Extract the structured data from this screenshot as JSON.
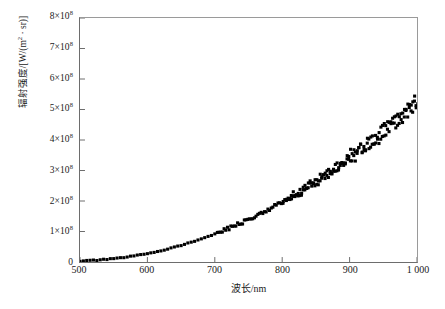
{
  "chart_data": {
    "type": "scatter",
    "title": "",
    "xlabel": "波长/nm",
    "ylabel": "辐射强度/[W/(m²·sr)]",
    "xlim": [
      500,
      1000
    ],
    "ylim": [
      0,
      800000000
    ],
    "y_exponent": 8,
    "y_scale_factor": 100000000,
    "grid": false,
    "legend": null,
    "marker": "square",
    "marker_color": "#000000",
    "marker_size_px": 3.1,
    "xticks": [
      500,
      600,
      700,
      800,
      900,
      1000
    ],
    "xtick_labels": [
      "500",
      "600",
      "700",
      "800",
      "900",
      "1 000"
    ],
    "yticks": [
      0,
      100000000,
      200000000,
      300000000,
      400000000,
      500000000,
      600000000,
      700000000,
      800000000
    ],
    "ytick_labels": [
      {
        "mantissa": "0",
        "has_power": false,
        "exponent": ""
      },
      {
        "mantissa": "1×10",
        "has_power": true,
        "exponent": "8"
      },
      {
        "mantissa": "2×10",
        "has_power": true,
        "exponent": "8"
      },
      {
        "mantissa": "3×10",
        "has_power": true,
        "exponent": "8"
      },
      {
        "mantissa": "4×10",
        "has_power": true,
        "exponent": "8"
      },
      {
        "mantissa": "5×10",
        "has_power": true,
        "exponent": "8"
      },
      {
        "mantissa": "6×10",
        "has_power": true,
        "exponent": "8"
      },
      {
        "mantissa": "7×10",
        "has_power": true,
        "exponent": "8"
      },
      {
        "mantissa": "8×10",
        "has_power": true,
        "exponent": "8"
      }
    ],
    "series": [
      {
        "name": "辐射强度",
        "x": [
          500,
          505,
          510,
          515,
          520,
          525,
          530,
          535,
          540,
          545,
          550,
          555,
          560,
          565,
          570,
          575,
          580,
          585,
          590,
          595,
          600,
          605,
          610,
          615,
          620,
          625,
          630,
          635,
          640,
          645,
          650,
          655,
          660,
          665,
          670,
          675,
          680,
          685,
          690,
          695,
          700,
          705,
          710,
          715,
          720,
          725,
          730,
          735,
          740,
          745,
          750,
          755,
          760,
          765,
          770,
          775,
          780,
          785,
          790,
          795,
          800,
          805,
          810,
          815,
          820,
          825,
          830,
          835,
          840,
          845,
          850,
          855,
          860,
          865,
          870,
          875,
          880,
          885,
          890,
          895,
          900,
          905,
          910,
          915,
          920,
          925,
          930,
          935,
          940,
          945,
          950,
          955,
          960,
          965,
          970,
          975,
          980,
          985,
          990,
          995,
          1000
        ],
        "y": [
          3000000,
          3500000,
          4000000,
          4600000,
          5200000,
          6000000,
          6800000,
          7600000,
          8600000,
          9600000,
          10800000,
          12000000,
          13400000,
          14800000,
          16400000,
          18000000,
          19800000,
          21600000,
          23600000,
          25600000,
          27800000,
          30000000,
          32400000,
          34800000,
          37400000,
          40000000,
          42800000,
          45600000,
          48600000,
          51600000,
          54800000,
          58000000,
          61400000,
          64800000,
          68400000,
          72000000,
          75800000,
          79600000,
          83600000,
          87600000,
          91800000,
          96000000,
          100400000,
          104800000,
          109400000,
          114000000,
          118800000,
          123600000,
          128600000,
          133600000,
          138800000,
          144000000,
          149400000,
          154800000,
          160400000,
          166000000,
          171800000,
          177600000,
          183600000,
          189600000,
          195800000,
          202000000,
          208400000,
          214800000,
          221400000,
          228000000,
          234800000,
          241600000,
          248600000,
          255600000,
          262800000,
          270000000,
          277400000,
          284800000,
          292400000,
          300000000,
          307800000,
          315600000,
          323600000,
          331600000,
          339800000,
          348000000,
          356400000,
          364800000,
          373400000,
          382000000,
          390800000,
          399600000,
          408600000,
          417600000,
          426800000,
          436000000,
          445400000,
          454800000,
          464400000,
          474000000,
          483800000,
          493600000,
          503600000,
          513600000,
          523800000
        ],
        "noise_amplitude_by_region": [
          {
            "x_start": 500,
            "x_end": 700,
            "amplitude": 1500000
          },
          {
            "x_start": 700,
            "x_end": 800,
            "amplitude": 5000000
          },
          {
            "x_start": 800,
            "x_end": 900,
            "amplitude": 12000000
          },
          {
            "x_start": 900,
            "x_end": 1000,
            "amplitude": 22000000
          }
        ],
        "peak_value": 540000000,
        "peak_x": 1000
      }
    ]
  },
  "caption": {
    "text": ""
  }
}
